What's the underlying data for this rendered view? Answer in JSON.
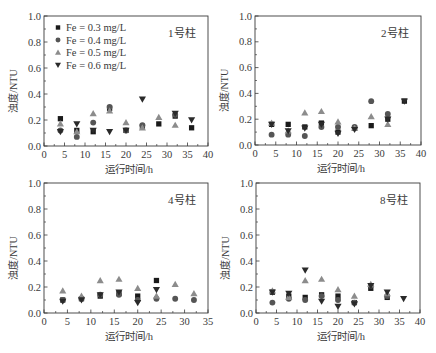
{
  "chart_data": [
    {
      "type": "scatter",
      "panel_label": "1号柱",
      "xlabel": "运行时间/h",
      "ylabel": "浊度/NTU",
      "xlim": [
        0,
        40
      ],
      "ylim": [
        0,
        1.0
      ],
      "xticks": [
        0,
        5,
        10,
        15,
        20,
        25,
        30,
        35,
        40
      ],
      "yticks": [
        "0.0",
        "0.2",
        "0.4",
        "0.6",
        "0.8",
        "1.0"
      ],
      "legend": true,
      "series": [
        {
          "name": "Fe = 0.3 mg/L",
          "marker": "square",
          "points": [
            [
              4,
              0.21
            ],
            [
              8,
              0.12
            ],
            [
              12,
              0.11
            ],
            [
              16,
              0.29
            ],
            [
              20,
              0.12
            ],
            [
              24,
              0.15
            ],
            [
              28,
              0.17
            ],
            [
              32,
              0.23
            ],
            [
              36,
              0.14
            ]
          ]
        },
        {
          "name": "Fe = 0.4 mg/L",
          "marker": "circle",
          "points": [
            [
              4,
              0.12
            ],
            [
              8,
              0.07
            ],
            [
              12,
              0.18
            ],
            [
              16,
              0.3
            ],
            [
              20,
              0.12
            ],
            [
              24,
              0.16
            ],
            [
              32,
              0.24
            ]
          ]
        },
        {
          "name": "Fe = 0.5 mg/L",
          "marker": "triangle-up",
          "points": [
            [
              4,
              0.17
            ],
            [
              8,
              0.11
            ],
            [
              12,
              0.25
            ],
            [
              16,
              0.27
            ],
            [
              20,
              0.18
            ],
            [
              24,
              0.14
            ],
            [
              28,
              0.22
            ],
            [
              32,
              0.16
            ]
          ]
        },
        {
          "name": "Fe = 0.6 mg/L",
          "marker": "triangle-down",
          "points": [
            [
              4,
              0.11
            ],
            [
              8,
              0.17
            ],
            [
              12,
              0.12
            ],
            [
              16,
              0.11
            ],
            [
              20,
              0.12
            ],
            [
              24,
              0.36
            ],
            [
              32,
              0.25
            ],
            [
              36,
              0.2
            ]
          ]
        }
      ]
    },
    {
      "type": "scatter",
      "panel_label": "2号柱",
      "xlabel": "运行时间/h",
      "ylabel": "浊度/NTU",
      "xlim": [
        0,
        40
      ],
      "ylim": [
        0,
        1.0
      ],
      "xticks": [
        0,
        5,
        10,
        15,
        20,
        25,
        30,
        35,
        40
      ],
      "yticks": [
        "0.0",
        "0.2",
        "0.4",
        "0.6",
        "0.8",
        "1.0"
      ],
      "legend": false,
      "series": [
        {
          "name": "Fe = 0.3 mg/L",
          "marker": "square",
          "points": [
            [
              4,
              0.16
            ],
            [
              8,
              0.16
            ],
            [
              12,
              0.14
            ],
            [
              16,
              0.17
            ],
            [
              20,
              0.1
            ],
            [
              24,
              0.13
            ],
            [
              28,
              0.15
            ],
            [
              32,
              0.2
            ],
            [
              36,
              0.34
            ]
          ]
        },
        {
          "name": "Fe = 0.4 mg/L",
          "marker": "circle",
          "points": [
            [
              4,
              0.08
            ],
            [
              8,
              0.08
            ],
            [
              12,
              0.07
            ],
            [
              16,
              0.14
            ],
            [
              20,
              0.14
            ],
            [
              24,
              0.14
            ],
            [
              28,
              0.34
            ],
            [
              32,
              0.24
            ]
          ]
        },
        {
          "name": "Fe = 0.5 mg/L",
          "marker": "triangle-up",
          "points": [
            [
              4,
              0.17
            ],
            [
              8,
              0.11
            ],
            [
              12,
              0.25
            ],
            [
              16,
              0.26
            ],
            [
              20,
              0.18
            ],
            [
              24,
              0.13
            ],
            [
              28,
              0.22
            ],
            [
              32,
              0.16
            ]
          ]
        },
        {
          "name": "Fe = 0.6 mg/L",
          "marker": "triangle-down",
          "points": [
            [
              4,
              0.16
            ],
            [
              8,
              0.11
            ],
            [
              12,
              0.13
            ],
            [
              16,
              0.16
            ],
            [
              20,
              0.09
            ],
            [
              24,
              0.12
            ],
            [
              32,
              0.2
            ],
            [
              36,
              0.34
            ]
          ]
        }
      ]
    },
    {
      "type": "scatter",
      "panel_label": "4号柱",
      "xlabel": "运行时间/h",
      "ylabel": "浊度/NTU",
      "xlim": [
        0,
        35
      ],
      "ylim": [
        0,
        1.0
      ],
      "xticks": [
        0,
        5,
        10,
        15,
        20,
        25,
        30,
        35
      ],
      "yticks": [
        "0.0",
        "0.2",
        "0.4",
        "0.6",
        "0.8",
        "1.0"
      ],
      "legend": false,
      "series": [
        {
          "name": "Fe = 0.3 mg/L",
          "marker": "square",
          "points": [
            [
              4,
              0.1
            ],
            [
              8,
              0.11
            ],
            [
              12,
              0.13
            ],
            [
              16,
              0.15
            ],
            [
              20,
              0.13
            ],
            [
              24,
              0.25
            ]
          ]
        },
        {
          "name": "Fe = 0.4 mg/L",
          "marker": "circle",
          "points": [
            [
              4,
              0.1
            ],
            [
              8,
              0.11
            ],
            [
              12,
              0.14
            ],
            [
              16,
              0.14
            ],
            [
              20,
              0.1
            ],
            [
              24,
              0.11
            ],
            [
              28,
              0.11
            ],
            [
              32,
              0.1
            ]
          ]
        },
        {
          "name": "Fe = 0.5 mg/L",
          "marker": "triangle-up",
          "points": [
            [
              4,
              0.17
            ],
            [
              8,
              0.13
            ],
            [
              12,
              0.25
            ],
            [
              16,
              0.26
            ],
            [
              20,
              0.19
            ],
            [
              24,
              0.13
            ],
            [
              28,
              0.22
            ],
            [
              32,
              0.15
            ]
          ]
        },
        {
          "name": "Fe = 0.6 mg/L",
          "marker": "triangle-down",
          "points": [
            [
              4,
              0.09
            ],
            [
              8,
              0.1
            ],
            [
              12,
              0.14
            ],
            [
              16,
              0.16
            ],
            [
              20,
              0.08
            ],
            [
              24,
              0.18
            ]
          ]
        }
      ]
    },
    {
      "type": "scatter",
      "panel_label": "8号柱",
      "xlabel": "运行时间/h",
      "ylabel": "浊度/NTU",
      "xlim": [
        0,
        40
      ],
      "ylim": [
        0,
        1.0
      ],
      "xticks": [
        0,
        5,
        10,
        15,
        20,
        25,
        30,
        35,
        40
      ],
      "yticks": [
        "0.0",
        "0.2",
        "0.4",
        "0.6",
        "0.8",
        "1.0"
      ],
      "legend": false,
      "series": [
        {
          "name": "Fe = 0.3 mg/L",
          "marker": "square",
          "points": [
            [
              4,
              0.16
            ],
            [
              8,
              0.13
            ],
            [
              12,
              0.12
            ],
            [
              16,
              0.14
            ],
            [
              20,
              0.13
            ],
            [
              24,
              0.08
            ],
            [
              28,
              0.19
            ],
            [
              32,
              0.12
            ]
          ]
        },
        {
          "name": "Fe = 0.4 mg/L",
          "marker": "circle",
          "points": [
            [
              4,
              0.08
            ],
            [
              8,
              0.11
            ],
            [
              12,
              0.1
            ],
            [
              16,
              0.13
            ],
            [
              20,
              0.1
            ],
            [
              24,
              0.08
            ],
            [
              28,
              0.21
            ],
            [
              32,
              0.13
            ]
          ]
        },
        {
          "name": "Fe = 0.5 mg/L",
          "marker": "triangle-up",
          "points": [
            [
              4,
              0.17
            ],
            [
              8,
              0.12
            ],
            [
              12,
              0.25
            ],
            [
              16,
              0.26
            ],
            [
              20,
              0.18
            ],
            [
              24,
              0.13
            ],
            [
              28,
              0.22
            ],
            [
              32,
              0.15
            ]
          ]
        },
        {
          "name": "Fe = 0.6 mg/L",
          "marker": "triangle-down",
          "points": [
            [
              4,
              0.16
            ],
            [
              8,
              0.15
            ],
            [
              12,
              0.33
            ],
            [
              16,
              0.09
            ],
            [
              20,
              0.05
            ],
            [
              24,
              0.07
            ],
            [
              28,
              0.21
            ],
            [
              32,
              0.16
            ],
            [
              36,
              0.11
            ]
          ]
        }
      ]
    }
  ],
  "style": {
    "axis_color": "#3a3a3a",
    "series_colors": [
      "#1a1a1a",
      "#555555",
      "#8c8c8c",
      "#2a2a2a"
    ]
  }
}
